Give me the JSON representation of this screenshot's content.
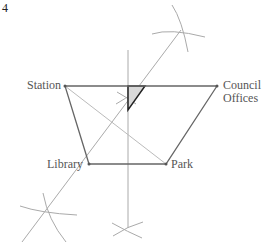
{
  "question_number": "4",
  "labels": {
    "station": "Station",
    "council_line1": "Council",
    "council_line2": "Offices",
    "library": "Library",
    "park": "Park"
  },
  "colors": {
    "quadrilateral": "#666666",
    "construction": "#aaaaaa",
    "shaded_region": "#d9d9d9",
    "shaded_outline": "#222222",
    "text": "#555555"
  },
  "points": {
    "station": [
      65,
      86
    ],
    "council_offices": [
      217,
      86
    ],
    "library": [
      89,
      164
    ],
    "park": [
      166,
      164
    ]
  }
}
